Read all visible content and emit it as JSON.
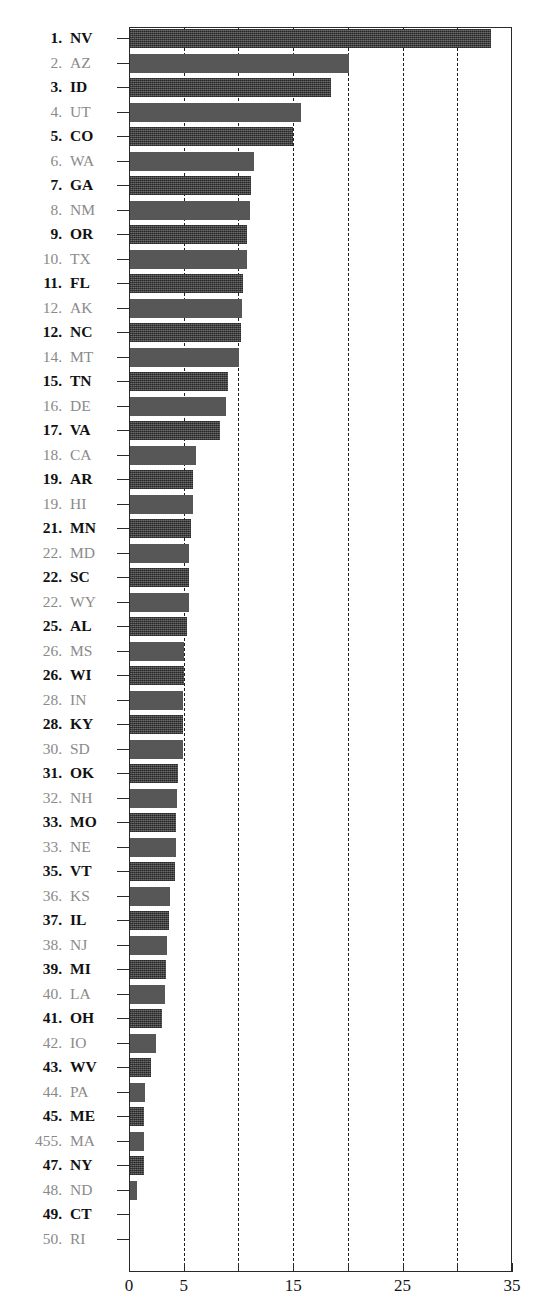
{
  "chart": {
    "title_partial": "",
    "type_label": "horizontal-bar"
  },
  "axis": {
    "x_tick_labels": [
      "0",
      "5",
      "15",
      "25",
      "35"
    ],
    "x_tick_values": [
      0,
      5,
      15,
      25,
      35
    ],
    "x_gridline_values": [
      5,
      10,
      15,
      20,
      25,
      30
    ],
    "x_minor_tick_values": [
      0,
      5,
      10,
      15,
      20,
      25,
      30,
      35
    ]
  },
  "chart_data": {
    "type": "bar",
    "orientation": "horizontal",
    "title": "",
    "xlabel": "",
    "ylabel": "",
    "xlim": [
      0,
      35
    ],
    "grid": true,
    "legend": "none",
    "tick_labels_shown": [
      "0",
      "5",
      "15",
      "25",
      "35"
    ],
    "categories": [
      "NV",
      "AZ",
      "ID",
      "UT",
      "CO",
      "WA",
      "GA",
      "NM",
      "OR",
      "TX",
      "FL",
      "AK",
      "NC",
      "MT",
      "TN",
      "DE",
      "VA",
      "CA",
      "AR",
      "HI",
      "MN",
      "MD",
      "SC",
      "WY",
      "AL",
      "MS",
      "WI",
      "IN",
      "KY",
      "SD",
      "OK",
      "NH",
      "MO",
      "NE",
      "VT",
      "KS",
      "IL",
      "NJ",
      "MI",
      "LA",
      "OH",
      "IO",
      "WV",
      "PA",
      "ME",
      "MA",
      "NY",
      "ND",
      "CT",
      "RI"
    ],
    "ranks": [
      "1.",
      "2.",
      "3.",
      "4.",
      "5.",
      "6.",
      "7.",
      "8.",
      "9.",
      "10.",
      "11.",
      "12.",
      "12.",
      "14.",
      "15.",
      "16.",
      "17.",
      "18.",
      "19.",
      "19.",
      "21.",
      "22.",
      "22.",
      "22.",
      "25.",
      "26.",
      "26.",
      "28.",
      "28.",
      "30.",
      "31.",
      "32.",
      "33.",
      "33.",
      "35.",
      "36.",
      "37.",
      "38.",
      "39.",
      "40.",
      "41.",
      "42.",
      "43.",
      "44.",
      "45.",
      "455.",
      "47.",
      "48.",
      "49.",
      "50."
    ],
    "values": [
      33.0,
      20.0,
      18.4,
      15.6,
      14.9,
      11.3,
      11.1,
      11.0,
      10.7,
      10.7,
      10.3,
      10.2,
      10.1,
      10.0,
      9.0,
      8.8,
      8.2,
      6.0,
      5.8,
      5.8,
      5.6,
      5.4,
      5.4,
      5.4,
      5.2,
      4.9,
      4.9,
      4.8,
      4.8,
      4.8,
      4.4,
      4.3,
      4.2,
      4.2,
      4.1,
      3.7,
      3.6,
      3.4,
      3.3,
      3.2,
      2.9,
      2.4,
      1.9,
      1.4,
      1.3,
      1.3,
      1.3,
      0.6,
      0.0,
      0.0
    ]
  },
  "style": {
    "bar_color_odd": "#4b4b4b",
    "bar_color_even": "#575757",
    "label_color_odd": "#111111",
    "label_color_even": "#8a8a8a",
    "axis_color": "#2a2a2a",
    "background": "#ffffff"
  }
}
